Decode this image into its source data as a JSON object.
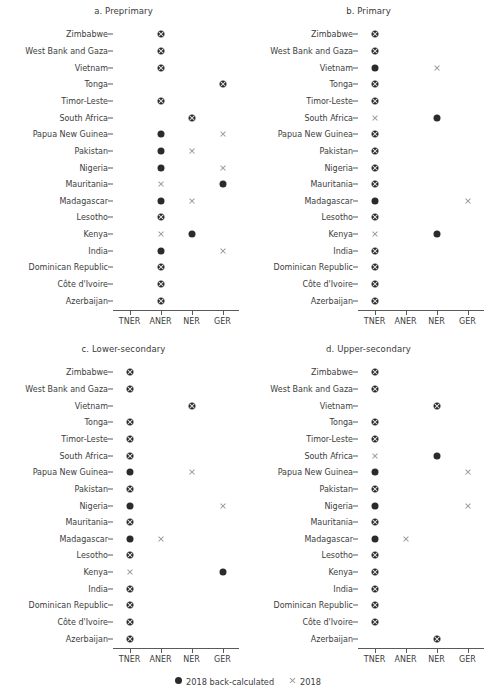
{
  "figure": {
    "width": 495,
    "height": 698,
    "background": "#ffffff"
  },
  "legend": {
    "items": [
      {
        "label": "2018  back-calculated",
        "symbol": "filled-circle",
        "color": "#2b2b2b"
      },
      {
        "label": "2018",
        "symbol": "cross",
        "color": "#9a9a9a"
      }
    ]
  },
  "chart_data": {
    "type": "scatter",
    "title": "",
    "xlabel": "",
    "ylabel": "",
    "grid": false,
    "legend_position": "bottom",
    "x_categories": [
      "TNER",
      "ANER",
      "NER",
      "GER"
    ],
    "y_categories": [
      "Zimbabwe",
      "West Bank and Gaza",
      "Vietnam",
      "Tonga",
      "Timor-Leste",
      "South Africa",
      "Papua New Guinea",
      "Pakistan",
      "Nigeria",
      "Mauritania",
      "Madagascar",
      "Lesotho",
      "Kenya",
      "India",
      "Dominican Republic",
      "Côte d'Ivoire",
      "Azerbaijan"
    ],
    "series": [
      {
        "name": "2018  back-calculated",
        "symbol": "filled-circle",
        "color": "#2b2b2b"
      },
      {
        "name": "2018",
        "symbol": "cross",
        "color": "#9a9a9a"
      }
    ],
    "panels": [
      {
        "id": "a",
        "title": "a. Preprimary",
        "points": [
          {
            "country": "Zimbabwe",
            "indicator": "ANER",
            "series": [
              "2018  back-calculated",
              "2018"
            ]
          },
          {
            "country": "West Bank and Gaza",
            "indicator": "ANER",
            "series": [
              "2018  back-calculated",
              "2018"
            ]
          },
          {
            "country": "Vietnam",
            "indicator": "ANER",
            "series": [
              "2018  back-calculated",
              "2018"
            ]
          },
          {
            "country": "Tonga",
            "indicator": "GER",
            "series": [
              "2018  back-calculated",
              "2018"
            ]
          },
          {
            "country": "Timor-Leste",
            "indicator": "ANER",
            "series": [
              "2018  back-calculated",
              "2018"
            ]
          },
          {
            "country": "South Africa",
            "indicator": "NER",
            "series": [
              "2018  back-calculated",
              "2018"
            ]
          },
          {
            "country": "Papua New Guinea",
            "indicator": "ANER",
            "series": [
              "2018  back-calculated"
            ]
          },
          {
            "country": "Papua New Guinea",
            "indicator": "GER",
            "series": [
              "2018"
            ]
          },
          {
            "country": "Pakistan",
            "indicator": "ANER",
            "series": [
              "2018  back-calculated"
            ]
          },
          {
            "country": "Pakistan",
            "indicator": "NER",
            "series": [
              "2018"
            ]
          },
          {
            "country": "Nigeria",
            "indicator": "ANER",
            "series": [
              "2018  back-calculated"
            ]
          },
          {
            "country": "Nigeria",
            "indicator": "GER",
            "series": [
              "2018"
            ]
          },
          {
            "country": "Mauritania",
            "indicator": "ANER",
            "series": [
              "2018"
            ]
          },
          {
            "country": "Mauritania",
            "indicator": "GER",
            "series": [
              "2018  back-calculated"
            ]
          },
          {
            "country": "Madagascar",
            "indicator": "ANER",
            "series": [
              "2018  back-calculated"
            ]
          },
          {
            "country": "Madagascar",
            "indicator": "NER",
            "series": [
              "2018"
            ]
          },
          {
            "country": "Lesotho",
            "indicator": "ANER",
            "series": [
              "2018  back-calculated",
              "2018"
            ]
          },
          {
            "country": "Kenya",
            "indicator": "ANER",
            "series": [
              "2018"
            ]
          },
          {
            "country": "Kenya",
            "indicator": "NER",
            "series": [
              "2018  back-calculated"
            ]
          },
          {
            "country": "India",
            "indicator": "ANER",
            "series": [
              "2018  back-calculated"
            ]
          },
          {
            "country": "India",
            "indicator": "GER",
            "series": [
              "2018"
            ]
          },
          {
            "country": "Dominican Republic",
            "indicator": "ANER",
            "series": [
              "2018  back-calculated",
              "2018"
            ]
          },
          {
            "country": "Côte d'Ivoire",
            "indicator": "ANER",
            "series": [
              "2018  back-calculated",
              "2018"
            ]
          },
          {
            "country": "Azerbaijan",
            "indicator": "ANER",
            "series": [
              "2018  back-calculated",
              "2018"
            ]
          }
        ]
      },
      {
        "id": "b",
        "title": "b. Primary",
        "points": [
          {
            "country": "Zimbabwe",
            "indicator": "TNER",
            "series": [
              "2018  back-calculated",
              "2018"
            ]
          },
          {
            "country": "West Bank and Gaza",
            "indicator": "TNER",
            "series": [
              "2018  back-calculated",
              "2018"
            ]
          },
          {
            "country": "Vietnam",
            "indicator": "TNER",
            "series": [
              "2018  back-calculated"
            ]
          },
          {
            "country": "Vietnam",
            "indicator": "NER",
            "series": [
              "2018"
            ]
          },
          {
            "country": "Tonga",
            "indicator": "TNER",
            "series": [
              "2018  back-calculated",
              "2018"
            ]
          },
          {
            "country": "Timor-Leste",
            "indicator": "TNER",
            "series": [
              "2018  back-calculated",
              "2018"
            ]
          },
          {
            "country": "South Africa",
            "indicator": "TNER",
            "series": [
              "2018"
            ]
          },
          {
            "country": "South Africa",
            "indicator": "NER",
            "series": [
              "2018  back-calculated"
            ]
          },
          {
            "country": "Papua New Guinea",
            "indicator": "TNER",
            "series": [
              "2018  back-calculated",
              "2018"
            ]
          },
          {
            "country": "Pakistan",
            "indicator": "TNER",
            "series": [
              "2018  back-calculated",
              "2018"
            ]
          },
          {
            "country": "Nigeria",
            "indicator": "TNER",
            "series": [
              "2018  back-calculated",
              "2018"
            ]
          },
          {
            "country": "Mauritania",
            "indicator": "TNER",
            "series": [
              "2018  back-calculated",
              "2018"
            ]
          },
          {
            "country": "Madagascar",
            "indicator": "TNER",
            "series": [
              "2018  back-calculated"
            ]
          },
          {
            "country": "Madagascar",
            "indicator": "GER",
            "series": [
              "2018"
            ]
          },
          {
            "country": "Lesotho",
            "indicator": "TNER",
            "series": [
              "2018  back-calculated",
              "2018"
            ]
          },
          {
            "country": "Kenya",
            "indicator": "TNER",
            "series": [
              "2018"
            ]
          },
          {
            "country": "Kenya",
            "indicator": "NER",
            "series": [
              "2018  back-calculated"
            ]
          },
          {
            "country": "India",
            "indicator": "TNER",
            "series": [
              "2018  back-calculated",
              "2018"
            ]
          },
          {
            "country": "Dominican Republic",
            "indicator": "TNER",
            "series": [
              "2018  back-calculated",
              "2018"
            ]
          },
          {
            "country": "Côte d'Ivoire",
            "indicator": "TNER",
            "series": [
              "2018  back-calculated",
              "2018"
            ]
          },
          {
            "country": "Azerbaijan",
            "indicator": "TNER",
            "series": [
              "2018  back-calculated",
              "2018"
            ]
          }
        ]
      },
      {
        "id": "c",
        "title": "c. Lower-secondary",
        "points": [
          {
            "country": "Zimbabwe",
            "indicator": "TNER",
            "series": [
              "2018  back-calculated",
              "2018"
            ]
          },
          {
            "country": "West Bank and Gaza",
            "indicator": "TNER",
            "series": [
              "2018  back-calculated",
              "2018"
            ]
          },
          {
            "country": "Vietnam",
            "indicator": "NER",
            "series": [
              "2018  back-calculated",
              "2018"
            ]
          },
          {
            "country": "Tonga",
            "indicator": "TNER",
            "series": [
              "2018  back-calculated",
              "2018"
            ]
          },
          {
            "country": "Timor-Leste",
            "indicator": "TNER",
            "series": [
              "2018  back-calculated",
              "2018"
            ]
          },
          {
            "country": "South Africa",
            "indicator": "TNER",
            "series": [
              "2018  back-calculated",
              "2018"
            ]
          },
          {
            "country": "Papua New Guinea",
            "indicator": "TNER",
            "series": [
              "2018  back-calculated"
            ]
          },
          {
            "country": "Papua New Guinea",
            "indicator": "NER",
            "series": [
              "2018"
            ]
          },
          {
            "country": "Pakistan",
            "indicator": "TNER",
            "series": [
              "2018  back-calculated",
              "2018"
            ]
          },
          {
            "country": "Nigeria",
            "indicator": "TNER",
            "series": [
              "2018  back-calculated"
            ]
          },
          {
            "country": "Nigeria",
            "indicator": "GER",
            "series": [
              "2018"
            ]
          },
          {
            "country": "Mauritania",
            "indicator": "TNER",
            "series": [
              "2018  back-calculated",
              "2018"
            ]
          },
          {
            "country": "Madagascar",
            "indicator": "TNER",
            "series": [
              "2018  back-calculated"
            ]
          },
          {
            "country": "Madagascar",
            "indicator": "ANER",
            "series": [
              "2018"
            ]
          },
          {
            "country": "Lesotho",
            "indicator": "TNER",
            "series": [
              "2018  back-calculated",
              "2018"
            ]
          },
          {
            "country": "Kenya",
            "indicator": "TNER",
            "series": [
              "2018"
            ]
          },
          {
            "country": "Kenya",
            "indicator": "GER",
            "series": [
              "2018  back-calculated"
            ]
          },
          {
            "country": "India",
            "indicator": "TNER",
            "series": [
              "2018  back-calculated",
              "2018"
            ]
          },
          {
            "country": "Dominican Republic",
            "indicator": "TNER",
            "series": [
              "2018  back-calculated",
              "2018"
            ]
          },
          {
            "country": "Côte d'Ivoire",
            "indicator": "TNER",
            "series": [
              "2018  back-calculated",
              "2018"
            ]
          },
          {
            "country": "Azerbaijan",
            "indicator": "TNER",
            "series": [
              "2018  back-calculated",
              "2018"
            ]
          }
        ]
      },
      {
        "id": "d",
        "title": "d. Upper-secondary",
        "points": [
          {
            "country": "Zimbabwe",
            "indicator": "TNER",
            "series": [
              "2018  back-calculated",
              "2018"
            ]
          },
          {
            "country": "West Bank and Gaza",
            "indicator": "TNER",
            "series": [
              "2018  back-calculated",
              "2018"
            ]
          },
          {
            "country": "Vietnam",
            "indicator": "NER",
            "series": [
              "2018  back-calculated",
              "2018"
            ]
          },
          {
            "country": "Tonga",
            "indicator": "TNER",
            "series": [
              "2018  back-calculated",
              "2018"
            ]
          },
          {
            "country": "Timor-Leste",
            "indicator": "TNER",
            "series": [
              "2018  back-calculated",
              "2018"
            ]
          },
          {
            "country": "South Africa",
            "indicator": "TNER",
            "series": [
              "2018"
            ]
          },
          {
            "country": "South Africa",
            "indicator": "NER",
            "series": [
              "2018  back-calculated"
            ]
          },
          {
            "country": "Papua New Guinea",
            "indicator": "TNER",
            "series": [
              "2018  back-calculated"
            ]
          },
          {
            "country": "Papua New Guinea",
            "indicator": "GER",
            "series": [
              "2018"
            ]
          },
          {
            "country": "Pakistan",
            "indicator": "TNER",
            "series": [
              "2018  back-calculated",
              "2018"
            ]
          },
          {
            "country": "Nigeria",
            "indicator": "TNER",
            "series": [
              "2018  back-calculated"
            ]
          },
          {
            "country": "Nigeria",
            "indicator": "GER",
            "series": [
              "2018"
            ]
          },
          {
            "country": "Mauritania",
            "indicator": "TNER",
            "series": [
              "2018  back-calculated",
              "2018"
            ]
          },
          {
            "country": "Madagascar",
            "indicator": "TNER",
            "series": [
              "2018  back-calculated"
            ]
          },
          {
            "country": "Madagascar",
            "indicator": "ANER",
            "series": [
              "2018"
            ]
          },
          {
            "country": "Lesotho",
            "indicator": "TNER",
            "series": [
              "2018  back-calculated",
              "2018"
            ]
          },
          {
            "country": "Kenya",
            "indicator": "TNER",
            "series": [
              "2018  back-calculated",
              "2018"
            ]
          },
          {
            "country": "India",
            "indicator": "TNER",
            "series": [
              "2018  back-calculated",
              "2018"
            ]
          },
          {
            "country": "Dominican Republic",
            "indicator": "TNER",
            "series": [
              "2018  back-calculated",
              "2018"
            ]
          },
          {
            "country": "Côte d'Ivoire",
            "indicator": "TNER",
            "series": [
              "2018  back-calculated",
              "2018"
            ]
          },
          {
            "country": "Azerbaijan",
            "indicator": "NER",
            "series": [
              "2018  back-calculated",
              "2018"
            ]
          }
        ]
      }
    ]
  }
}
